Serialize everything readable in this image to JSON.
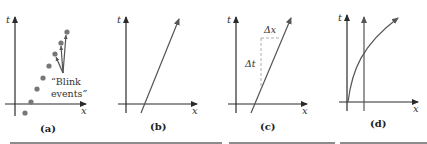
{
  "figure": {
    "panels": [
      {
        "id": "a",
        "caption": "(a)",
        "t_label": "t",
        "x_label": "x",
        "annotation_line1": "“Blink",
        "annotation_line2": "events”",
        "points": [
          [
            25,
            113
          ],
          [
            31,
            102
          ],
          [
            37,
            89
          ],
          [
            43,
            78
          ],
          [
            49,
            66
          ],
          [
            55,
            54
          ],
          [
            61,
            43
          ],
          [
            67,
            32
          ]
        ]
      },
      {
        "id": "b",
        "caption": "(b)",
        "t_label": "t",
        "x_label": "x",
        "description": "straight inclined worldline"
      },
      {
        "id": "c",
        "caption": "(c)",
        "t_label": "t",
        "x_label": "x",
        "dx_label": "Δx",
        "dt_label": "Δt",
        "description": "inclined worldline with Δx and Δt"
      },
      {
        "id": "d",
        "caption": "(d)",
        "t_label": "t",
        "x_label": "x",
        "description": "vertical worldline and curved worldline"
      }
    ],
    "colors": {
      "axis": "#2a2a2a",
      "worldline": "#555555",
      "dot": "#777777"
    }
  }
}
